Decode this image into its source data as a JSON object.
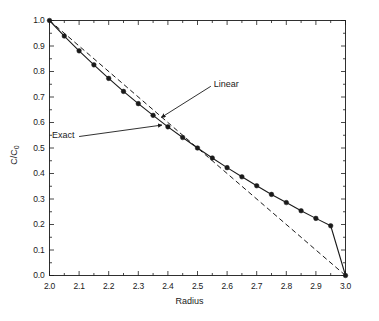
{
  "chart_data": {
    "type": "line",
    "title": "",
    "xlabel": "Radius",
    "ylabel": "C/C0",
    "ylabel_display": "C/C",
    "ylabel_sub": "0",
    "xlim": [
      2.0,
      3.0
    ],
    "ylim": [
      0.0,
      1.0
    ],
    "grid": false,
    "legend": "none",
    "x_ticks": [
      "2.0",
      "2.1",
      "2.2",
      "2.3",
      "2.4",
      "2.5",
      "2.6",
      "2.7",
      "2.8",
      "2.9",
      "3.0"
    ],
    "x_tick_values": [
      2.0,
      2.1,
      2.2,
      2.3,
      2.4,
      2.5,
      2.6,
      2.7,
      2.8,
      2.9,
      3.0
    ],
    "x_minor_step": 0.05,
    "y_ticks": [
      "0.0",
      "0.1",
      "0.2",
      "0.3",
      "0.4",
      "0.5",
      "0.6",
      "0.7",
      "0.8",
      "0.9",
      "1.0"
    ],
    "y_tick_values": [
      0.0,
      0.1,
      0.2,
      0.3,
      0.4,
      0.5,
      0.6,
      0.7,
      0.8,
      0.9,
      1.0
    ],
    "y_minor_step": 0.05,
    "series": [
      {
        "name": "Exact",
        "style": "solid",
        "marker": "filled-circle",
        "color": "#1a1a1a",
        "x": [
          2.0,
          2.05,
          2.1,
          2.15,
          2.2,
          2.25,
          2.3,
          2.35,
          2.4,
          2.45,
          2.5,
          2.55,
          2.6,
          2.65,
          2.7,
          2.75,
          2.8,
          2.85,
          2.9,
          2.95,
          3.0
        ],
        "values": [
          1.0,
          0.939,
          0.881,
          0.826,
          0.773,
          0.722,
          0.674,
          0.628,
          0.583,
          0.541,
          0.5,
          0.461,
          0.423,
          0.387,
          0.352,
          0.318,
          0.286,
          0.254,
          0.224,
          0.195,
          0.0
        ]
      },
      {
        "name": "Linear",
        "style": "dashed",
        "marker": "none",
        "color": "#1a1a1a",
        "x": [
          2.0,
          3.0
        ],
        "values": [
          1.0,
          0.0
        ]
      }
    ],
    "annotations": [
      {
        "text": "Linear",
        "label_x": 2.545,
        "label_y": 0.742,
        "arrow_to_x": 2.378,
        "arrow_to_y": 0.62
      },
      {
        "text": "Exact",
        "label_x": 2.1,
        "label_y": 0.545,
        "arrow_to_x": 2.38,
        "arrow_to_y": 0.59
      }
    ]
  },
  "axis": {
    "x_title": "Radius",
    "y_title_main": "C/C",
    "y_title_sub": "0"
  },
  "annotations": {
    "linear": "Linear",
    "exact": "Exact"
  },
  "colors": {
    "axis": "#1a1a1a",
    "curve": "#1a1a1a",
    "background": "#ffffff"
  }
}
